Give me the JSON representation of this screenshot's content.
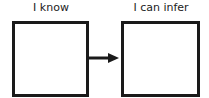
{
  "diagram": {
    "left": {
      "label": "I know",
      "content": ""
    },
    "right": {
      "label": "I can infer",
      "content": ""
    },
    "arrow": {
      "direction": "right",
      "color": "#1a1a1a"
    }
  }
}
